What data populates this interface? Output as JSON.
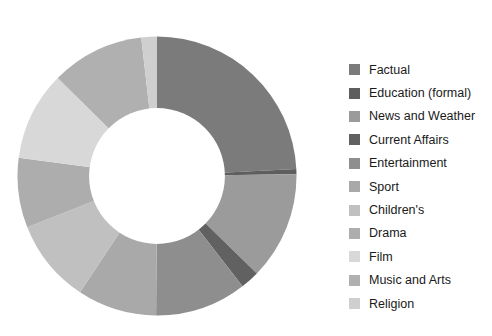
{
  "chart_data": {
    "type": "pie",
    "variant": "donut",
    "title": "",
    "subtitle": "",
    "xlabel": "",
    "ylabel": "",
    "grid": false,
    "legend_position": "right",
    "start_angle_deg": 0,
    "direction": "clockwise",
    "inner_radius_ratio": 0.485,
    "categories": [
      "Factual",
      "Education (formal)",
      "News and Weather",
      "Current Affairs",
      "Entertainment",
      "Sport",
      "Children's",
      "Drama",
      "Film",
      "Music and Arts",
      "Religion"
    ],
    "values": [
      24.2,
      0.6,
      12.5,
      2.2,
      10.6,
      9.2,
      9.7,
      8.1,
      10.3,
      10.8,
      1.8
    ],
    "unit": "%",
    "colors": [
      "#7b7b7b",
      "#5e5e5e",
      "#9b9b9b",
      "#616161",
      "#8e8e8e",
      "#a9a9a9",
      "#c0c0c0",
      "#adadad",
      "#d8d8d8",
      "#b0b0b0",
      "#cfcfcf"
    ],
    "slices": [
      {
        "label": "Factual",
        "value": 24.2,
        "color": "#7b7b7b"
      },
      {
        "label": "Education (formal)",
        "value": 0.6,
        "color": "#5e5e5e"
      },
      {
        "label": "News and Weather",
        "value": 12.5,
        "color": "#9b9b9b"
      },
      {
        "label": "Current Affairs",
        "value": 2.2,
        "color": "#616161"
      },
      {
        "label": "Entertainment",
        "value": 10.6,
        "color": "#8e8e8e"
      },
      {
        "label": "Sport",
        "value": 9.2,
        "color": "#a9a9a9"
      },
      {
        "label": "Children's",
        "value": 9.7,
        "color": "#c0c0c0"
      },
      {
        "label": "Drama",
        "value": 8.1,
        "color": "#adadad"
      },
      {
        "label": "Film",
        "value": 10.3,
        "color": "#d8d8d8"
      },
      {
        "label": "Music and Arts",
        "value": 10.8,
        "color": "#b0b0b0"
      },
      {
        "label": "Religion",
        "value": 1.8,
        "color": "#cfcfcf"
      }
    ]
  },
  "legend": {
    "items": [
      {
        "label": "Factual",
        "color": "#7b7b7b"
      },
      {
        "label": "Education (formal)",
        "color": "#5e5e5e"
      },
      {
        "label": "News and Weather",
        "color": "#9b9b9b"
      },
      {
        "label": "Current Affairs",
        "color": "#616161"
      },
      {
        "label": "Entertainment",
        "color": "#8e8e8e"
      },
      {
        "label": "Sport",
        "color": "#a9a9a9"
      },
      {
        "label": "Children's",
        "color": "#c0c0c0"
      },
      {
        "label": "Drama",
        "color": "#adadad"
      },
      {
        "label": "Film",
        "color": "#d8d8d8"
      },
      {
        "label": "Music and Arts",
        "color": "#b0b0b0"
      },
      {
        "label": "Religion",
        "color": "#cfcfcf"
      }
    ]
  },
  "figure": {
    "background": "#ffffff",
    "hole_color": "#ffffff"
  }
}
